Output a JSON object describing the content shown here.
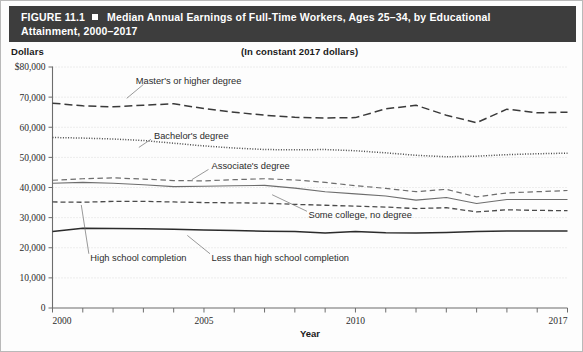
{
  "figure": {
    "number": "FIGURE 11.1",
    "title_line1": "Median Annual Earnings of Full-Time Workers, Ages 25–34, by Educational",
    "title_line2": "Attainment, 2000–2017",
    "bullet_icon": "square-bullet-icon"
  },
  "labels": {
    "dollars": "Dollars",
    "constant": "(In constant 2017 dollars)"
  },
  "chart_data": {
    "type": "line",
    "subtitle": "(In constant 2017 dollars)",
    "xlabel": "Year",
    "ylabel": "Dollars",
    "xlim": [
      2000,
      2017
    ],
    "ylim": [
      0,
      80000
    ],
    "grid": true,
    "legend": "inline-annotations",
    "x": [
      2000,
      2001,
      2002,
      2003,
      2004,
      2005,
      2006,
      2007,
      2008,
      2009,
      2010,
      2011,
      2012,
      2013,
      2014,
      2015,
      2016,
      2017
    ],
    "ytick_labels": [
      "$80,000",
      "70,000",
      "60,000",
      "50,000",
      "40,000",
      "30,000",
      "20,000",
      "10,000",
      "0"
    ],
    "ytick_values": [
      80000,
      70000,
      60000,
      50000,
      40000,
      30000,
      20000,
      10000,
      0
    ],
    "xtick_labels": [
      "2000",
      "2005",
      "2010",
      "2017"
    ],
    "xtick_values": [
      2000,
      2005,
      2010,
      2017
    ],
    "series": [
      {
        "name": "Master's or higher degree",
        "style": "long-dash",
        "color": "#3a3a3a",
        "label_x": 2002.6,
        "label_y": 75500,
        "values": [
          68000,
          67100,
          66800,
          67300,
          67800,
          66200,
          65000,
          64000,
          63300,
          63100,
          63200,
          66100,
          67300,
          64000,
          61500,
          66000,
          64800,
          65000
        ]
      },
      {
        "name": "Bachelor's degree",
        "style": "dotted",
        "color": "#4a4a4a",
        "label_x": 2003.2,
        "label_y": 57200,
        "values": [
          56600,
          56400,
          56100,
          55600,
          54700,
          53800,
          53100,
          52600,
          52500,
          52600,
          52200,
          51500,
          50700,
          50200,
          50400,
          50900,
          51200,
          51400
        ]
      },
      {
        "name": "Associate's degree",
        "style": "dash",
        "color": "#6d6d6d",
        "label_x": 2005.1,
        "label_y": 47200,
        "values": [
          42400,
          42900,
          43200,
          42800,
          42300,
          42200,
          42600,
          42900,
          42500,
          41700,
          40600,
          39700,
          38600,
          39400,
          36900,
          38200,
          38600,
          39000
        ]
      },
      {
        "name": "Some college, no degree",
        "style": "solid-gray",
        "color": "#6d6d6d",
        "label_x": 2008.3,
        "label_y": 30900,
        "values": [
          41400,
          41700,
          41400,
          40900,
          40300,
          40400,
          40600,
          40700,
          39800,
          38600,
          37900,
          37200,
          35800,
          36700,
          34700,
          36000,
          36000,
          36000
        ]
      },
      {
        "name": "High school completion",
        "style": "dash-medium",
        "color": "#4a4a4a",
        "label_x": 2001.1,
        "label_y": 16800,
        "values": [
          35200,
          35100,
          35400,
          35400,
          35200,
          35000,
          34900,
          34800,
          34400,
          34100,
          33800,
          33500,
          33000,
          33300,
          31900,
          32600,
          32400,
          32300
        ]
      },
      {
        "name": "Less than high school completion",
        "style": "solid-dark",
        "color": "#2b2b2b",
        "label_x": 2005.1,
        "label_y": 16800,
        "values": [
          25400,
          26500,
          26400,
          26300,
          26100,
          25900,
          25700,
          25500,
          25400,
          24900,
          25400,
          25000,
          24900,
          25100,
          25400,
          25600,
          25600,
          25600
        ]
      }
    ]
  }
}
